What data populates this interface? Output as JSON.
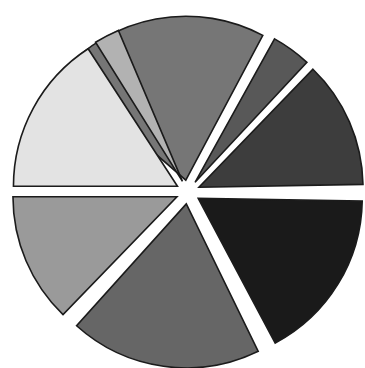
{
  "figure": {
    "background_color": "#ffffff",
    "width": 365,
    "height": 368
  },
  "chart_data": {
    "type": "pie",
    "title": "",
    "subtitle": "",
    "xlabel": "",
    "ylabel": "",
    "grid": false,
    "legend": "none",
    "exploded": true,
    "labels_visible": false,
    "center": {
      "x": 188,
      "y": 192
    },
    "radius": 164,
    "start_angle_deg": 90,
    "direction": "clockwise",
    "explode_distance_px": 12,
    "edge_color": "#1b1b1b",
    "edge_width": 1.6,
    "categories": [
      "Slice 1",
      "Slice 2",
      "Slice 3",
      "Slice 4",
      "Slice 5",
      "Slice 6",
      "Slice 7",
      "Slice 8"
    ],
    "values": [
      21.5,
      4.0,
      17.0,
      18.5,
      19.5,
      14.5,
      2.5,
      2.5
    ],
    "percentages": [
      21.5,
      4.0,
      17.0,
      18.5,
      19.5,
      14.5,
      2.5,
      2.5
    ],
    "colors": [
      "#767676",
      "#585858",
      "#3d3d3d",
      "#1a1a1a",
      "#666666",
      "#9a9a9a",
      "#e3e3e3",
      "#b2b2b2"
    ],
    "slices": [
      {
        "name": "slice-top-medium-gray",
        "color": "#767676",
        "value": 21.5,
        "start_deg": 62,
        "end_deg": 139,
        "explode": 12
      },
      {
        "name": "slice-upper-right-thin",
        "color": "#585858",
        "value": 4.0,
        "start_deg": 47,
        "end_deg": 61,
        "explode": 12
      },
      {
        "name": "slice-right-upper-dark",
        "color": "#3d3d3d",
        "value": 17.0,
        "start_deg": 1,
        "end_deg": 46,
        "explode": 12
      },
      {
        "name": "slice-right-lower-darkest",
        "color": "#1a1a1a",
        "value": 18.5,
        "start_deg": -62,
        "end_deg": -1,
        "explode": 12
      },
      {
        "name": "slice-bottom-dark-gray",
        "color": "#666666",
        "value": 19.5,
        "start_deg": -132,
        "end_deg": -64,
        "explode": 12
      },
      {
        "name": "slice-left-lower-mid-gray",
        "color": "#9a9a9a",
        "value": 14.5,
        "start_deg": -180,
        "end_deg": -134,
        "explode": 12
      },
      {
        "name": "slice-left-upper-lightest",
        "color": "#e3e3e3",
        "value": 18.0,
        "start_deg": 123,
        "end_deg": 180,
        "explode": 12
      },
      {
        "name": "slice-upper-left-thin-light",
        "color": "#b2b2b2",
        "value": 2.5,
        "start_deg": 113,
        "end_deg": 122,
        "explode": 12
      }
    ]
  }
}
